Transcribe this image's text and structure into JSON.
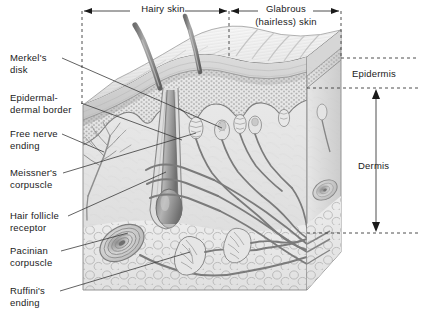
{
  "figure": {
    "background_color": "#ffffff",
    "line_color": "#3a3a3a",
    "text_color": "#1a1a1a",
    "skin_tone_light": "#e9e9e9",
    "skin_tone_mid": "#cfcfcf",
    "skin_tone_dark": "#9a9a9a",
    "hair_color": "#8a8a8a"
  },
  "top_labels": [
    {
      "id": "hairy-skin",
      "text": "Hairy skin",
      "lines": [
        "Hairy skin"
      ]
    },
    {
      "id": "glabrous-skin",
      "text": "Glabrous (hairless) skin",
      "lines": [
        "Glabrous",
        "(hairless) skin"
      ]
    }
  ],
  "right_labels": [
    {
      "id": "epidermis",
      "text": "Epidermis"
    },
    {
      "id": "dermis",
      "text": "Dermis"
    }
  ],
  "left_labels": [
    {
      "id": "merkels-disk",
      "line1": "Merkel's",
      "line2": "disk"
    },
    {
      "id": "epidermal-dermal-border",
      "line1": "Epidermal-",
      "line2": "dermal border"
    },
    {
      "id": "free-nerve-ending",
      "line1": "Free nerve",
      "line2": "ending"
    },
    {
      "id": "meissners-corpuscle",
      "line1": "Meissner's",
      "line2": "corpuscle"
    },
    {
      "id": "hair-follicle-receptor",
      "line1": "Hair follicle",
      "line2": "receptor"
    },
    {
      "id": "pacinian-corpuscle",
      "line1": "Pacinian",
      "line2": "corpuscle"
    },
    {
      "id": "ruffinis-ending",
      "line1": "Ruffini's",
      "line2": "ending"
    }
  ]
}
